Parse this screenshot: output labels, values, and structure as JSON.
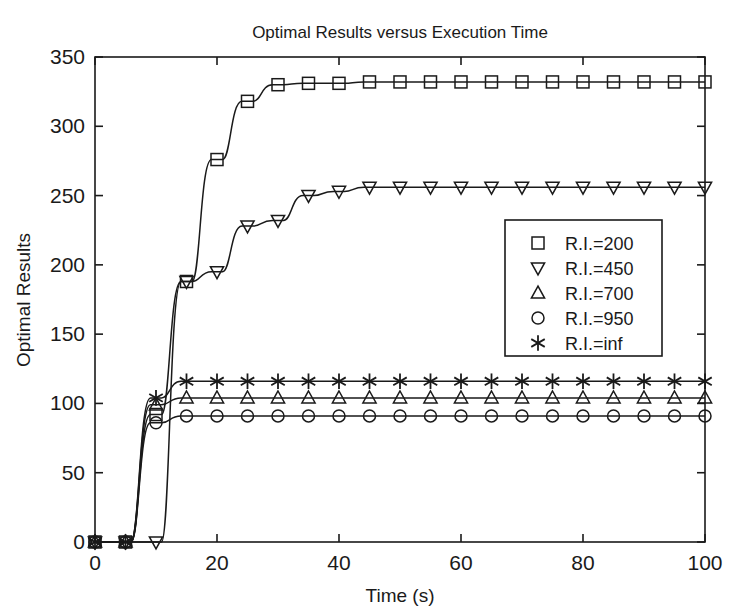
{
  "chart_data": {
    "type": "line",
    "title": "Optimal Results versus Execution Time",
    "xlabel": "Time (s)",
    "ylabel": "Optimal Results",
    "xlim": [
      0,
      100
    ],
    "ylim": [
      0,
      350
    ],
    "xticks": [
      0,
      20,
      40,
      60,
      80,
      100
    ],
    "yticks": [
      0,
      50,
      100,
      150,
      200,
      250,
      300,
      350
    ],
    "grid": false,
    "legend_position": "center-right",
    "marker_interval": 5,
    "x": [
      0,
      5,
      10,
      15,
      20,
      25,
      30,
      35,
      40,
      45,
      50,
      55,
      60,
      65,
      70,
      75,
      80,
      85,
      90,
      95,
      100
    ],
    "series": [
      {
        "name": "R.I.=200",
        "marker": "square",
        "values": [
          0,
          0,
          92,
          188,
          276,
          318,
          330,
          331,
          331,
          332,
          332,
          332,
          332,
          332,
          332,
          332,
          332,
          332,
          332,
          332,
          332
        ]
      },
      {
        "name": "R.I.=450",
        "marker": "triangle-down",
        "values": [
          0,
          0,
          0,
          188,
          195,
          228,
          232,
          250,
          253,
          256,
          256,
          256,
          256,
          256,
          256,
          256,
          256,
          256,
          256,
          256,
          256
        ]
      },
      {
        "name": "R.I.=700",
        "marker": "triangle-up",
        "values": [
          0,
          0,
          99,
          104,
          104,
          104,
          104,
          104,
          104,
          104,
          104,
          104,
          104,
          104,
          104,
          104,
          104,
          104,
          104,
          104,
          104
        ]
      },
      {
        "name": "R.I.=950",
        "marker": "circle",
        "values": [
          0,
          0,
          86,
          91,
          91,
          91,
          91,
          91,
          91,
          91,
          91,
          91,
          91,
          91,
          91,
          91,
          91,
          91,
          91,
          91,
          91
        ]
      },
      {
        "name": "R.I.=inf",
        "marker": "asterisk",
        "values": [
          0,
          0,
          104,
          116,
          116,
          116,
          116,
          116,
          116,
          116,
          116,
          116,
          116,
          116,
          116,
          116,
          116,
          116,
          116,
          116,
          116
        ]
      }
    ],
    "colors": {
      "line": "#1a1a1a",
      "axis": "#1a1a1a",
      "background": "#ffffff"
    }
  },
  "legend": {
    "entries": [
      {
        "label": "R.I.=200",
        "marker": "square"
      },
      {
        "label": "R.I.=450",
        "marker": "triangle-down"
      },
      {
        "label": "R.I.=700",
        "marker": "triangle-up"
      },
      {
        "label": "R.I.=950",
        "marker": "circle"
      },
      {
        "label": "R.I.=inf",
        "marker": "asterisk"
      }
    ]
  },
  "axis": {
    "x_tick_labels": [
      "0",
      "20",
      "40",
      "60",
      "80",
      "100"
    ],
    "y_tick_labels": [
      "0",
      "50",
      "100",
      "150",
      "200",
      "250",
      "300",
      "350"
    ]
  }
}
